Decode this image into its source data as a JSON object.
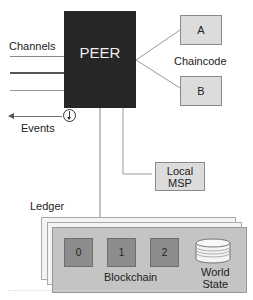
{
  "peer": {
    "label": "PEER"
  },
  "channels": {
    "label": "Channels"
  },
  "events": {
    "label": "Events"
  },
  "chaincode": {
    "label": "Chaincode",
    "items": [
      {
        "label": "A"
      },
      {
        "label": "B"
      }
    ]
  },
  "local_msp": {
    "label_line1": "Local",
    "label_line2": "MSP"
  },
  "ledger": {
    "label": "Ledger",
    "blockchain": {
      "label": "Blockchain",
      "blocks": [
        {
          "label": "0"
        },
        {
          "label": "1"
        },
        {
          "label": "2"
        }
      ]
    },
    "world_state": {
      "label_line1": "World",
      "label_line2": "State"
    }
  },
  "colors": {
    "peer_fill": "#262626",
    "box_fill": "#dcdcdc",
    "block_fill": "#8c8c8c",
    "ledger_front": "#c4c4c4"
  }
}
